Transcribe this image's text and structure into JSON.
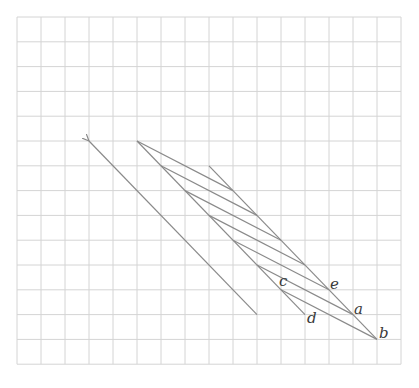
{
  "grid": {
    "origin_x": 17,
    "origin_y": 17,
    "cols": 16,
    "rows": 14,
    "cell_w": 24,
    "cell_h": 24.8,
    "color": "#d4d4d4"
  },
  "line_color": "#8a8a8a",
  "arrow": {
    "from": [
      10,
      12
    ],
    "to": [
      3,
      5
    ]
  },
  "edges": [
    {
      "name": "left-edge",
      "from": [
        5,
        5
      ],
      "to": [
        12,
        12
      ]
    },
    {
      "name": "right-edge",
      "from": [
        8,
        6
      ],
      "to": [
        15,
        13
      ]
    }
  ],
  "parallel_segments": [
    {
      "from": [
        5,
        5
      ],
      "to": [
        9,
        7
      ]
    },
    {
      "from": [
        6,
        6
      ],
      "to": [
        10,
        8
      ]
    },
    {
      "from": [
        7,
        7
      ],
      "to": [
        11,
        9
      ]
    },
    {
      "from": [
        8,
        8
      ],
      "to": [
        12,
        10
      ]
    },
    {
      "from": [
        9,
        9
      ],
      "to": [
        13,
        11
      ]
    },
    {
      "from": [
        10,
        10
      ],
      "to": [
        14,
        12
      ]
    },
    {
      "from": [
        11,
        11
      ],
      "to": [
        15,
        13
      ]
    }
  ],
  "labels": [
    {
      "text": "c",
      "at": [
        11,
        11
      ],
      "dx": -2,
      "dy": -4
    },
    {
      "text": "d",
      "at": [
        12,
        12
      ],
      "dx": 2,
      "dy": 8
    },
    {
      "text": "e",
      "at": [
        13,
        11
      ],
      "dx": 1,
      "dy": -1
    },
    {
      "text": "a",
      "at": [
        14,
        12
      ],
      "dx": 1,
      "dy": -1
    },
    {
      "text": "b",
      "at": [
        15,
        13
      ],
      "dx": 2,
      "dy": -1
    }
  ]
}
